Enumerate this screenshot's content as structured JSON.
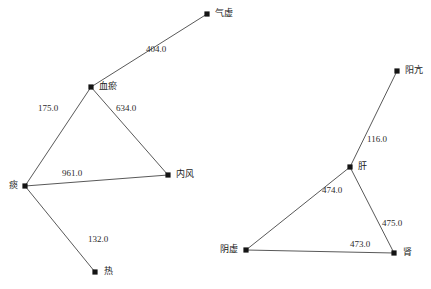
{
  "chart_data": {
    "type": "diagram",
    "subtype": "node-link-network",
    "title": "",
    "xlabel": "",
    "ylabel": "",
    "grid": false,
    "legend": null,
    "background_color": "#ffffff",
    "node_color": "#141414",
    "edge_color": "#595959",
    "label_color": "#1a1a1a",
    "width": 431,
    "height": 289,
    "nodes": [
      {
        "id": "qixu",
        "label": "气虚",
        "x": 207,
        "y": 14,
        "label_dx": 8,
        "label_dy": -5,
        "component": 1
      },
      {
        "id": "xueyu",
        "label": "血瘀",
        "x": 91,
        "y": 87,
        "label_dx": 8,
        "label_dy": -5,
        "component": 1
      },
      {
        "id": "tan",
        "label": "痰",
        "x": 25,
        "y": 186,
        "label_dx": -16,
        "label_dy": -5,
        "component": 1
      },
      {
        "id": "neifeng",
        "label": "内风",
        "x": 168,
        "y": 175,
        "label_dx": 8,
        "label_dy": -5,
        "component": 1
      },
      {
        "id": "re",
        "label": "热",
        "x": 95,
        "y": 272,
        "label_dx": 9,
        "label_dy": -5,
        "component": 1
      },
      {
        "id": "yangkang",
        "label": "阳亢",
        "x": 397,
        "y": 71,
        "label_dx": 8,
        "label_dy": -5,
        "component": 2
      },
      {
        "id": "gan",
        "label": "肝",
        "x": 350,
        "y": 167,
        "label_dx": 8,
        "label_dy": -5,
        "component": 2
      },
      {
        "id": "yinxu",
        "label": "阴虚",
        "x": 246,
        "y": 250,
        "label_dx": -26,
        "label_dy": -5,
        "component": 2
      },
      {
        "id": "shen",
        "label": "肾",
        "x": 394,
        "y": 253,
        "label_dx": 9,
        "label_dy": -5,
        "component": 2
      }
    ],
    "edges": [
      {
        "source": "xueyu",
        "target": "qixu",
        "weight": "404.0",
        "label_x": 146,
        "label_y": 45,
        "component": 1
      },
      {
        "source": "xueyu",
        "target": "tan",
        "weight": "175.0",
        "label_x": 38,
        "label_y": 104,
        "component": 1
      },
      {
        "source": "xueyu",
        "target": "neifeng",
        "weight": "634.0",
        "label_x": 116,
        "label_y": 104,
        "component": 1
      },
      {
        "source": "tan",
        "target": "neifeng",
        "weight": "961.0",
        "label_x": 62,
        "label_y": 169,
        "component": 1
      },
      {
        "source": "tan",
        "target": "re",
        "weight": "132.0",
        "label_x": 88,
        "label_y": 235,
        "component": 1
      },
      {
        "source": "gan",
        "target": "yangkang",
        "weight": "116.0",
        "label_x": 367,
        "label_y": 135,
        "component": 2
      },
      {
        "source": "gan",
        "target": "yinxu",
        "weight": "474.0",
        "label_x": 322,
        "label_y": 186,
        "component": 2
      },
      {
        "source": "gan",
        "target": "shen",
        "weight": "475.0",
        "label_x": 382,
        "label_y": 219,
        "component": 2
      },
      {
        "source": "yinxu",
        "target": "shen",
        "weight": "473.0",
        "label_x": 350,
        "label_y": 240,
        "component": 2
      }
    ]
  }
}
